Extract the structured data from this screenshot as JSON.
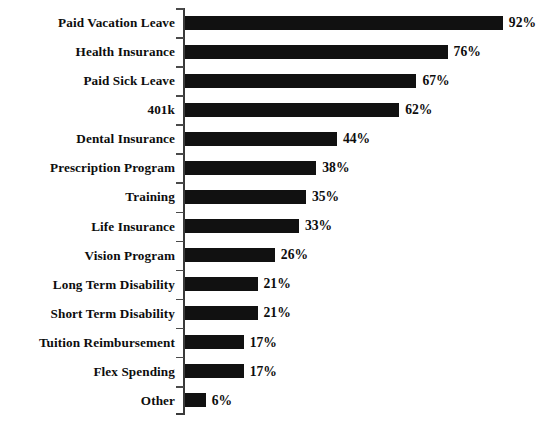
{
  "chart_data": {
    "type": "bar",
    "orientation": "horizontal",
    "title": "",
    "subtitle": "",
    "xlabel": "",
    "ylabel": "",
    "xlim": [
      0,
      100
    ],
    "grid": false,
    "legend": null,
    "value_suffix": "%",
    "bar_color": "#111111",
    "axis_color": "#3a3a3a",
    "background_color": "#ffffff",
    "categories": [
      "Paid Vacation Leave",
      "Health Insurance",
      "Paid Sick Leave",
      "401k",
      "Dental Insurance",
      "Prescription Program",
      "Training",
      "Life Insurance",
      "Vision Program",
      "Long Term Disability",
      "Short Term Disability",
      "Tuition Reimbursement",
      "Flex Spending",
      "Other"
    ],
    "values": [
      92,
      76,
      67,
      62,
      44,
      38,
      35,
      33,
      26,
      21,
      21,
      17,
      17,
      6
    ],
    "value_labels": [
      "92%",
      "76%",
      "67%",
      "62%",
      "44%",
      "38%",
      "35%",
      "33%",
      "26%",
      "21%",
      "21%",
      "17%",
      "17%",
      "6%"
    ]
  }
}
